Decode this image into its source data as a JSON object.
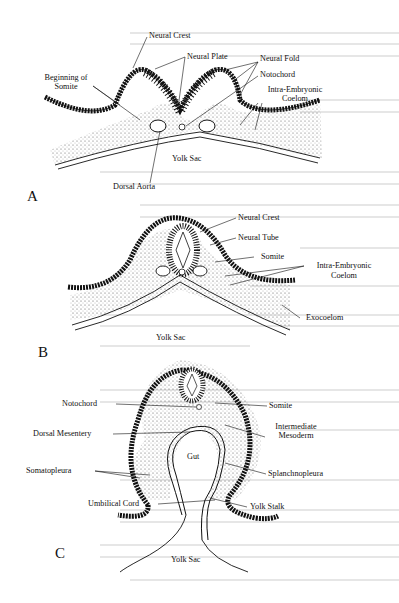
{
  "figure": {
    "panels": [
      {
        "id": "A",
        "label": "A",
        "labels": {
          "neural_crest": "Neural Crest",
          "neural_plate": "Neural Plate",
          "neural_fold": "Neural Fold",
          "notochord": "Notochord",
          "beginning_of": "Beginning of",
          "somite": "Somite",
          "intra_embryonic": "Intra-Embryonic",
          "coelom": "Coelom",
          "yolk_sac": "Yolk Sac",
          "dorsal_aorta": "Dorsal Aorta"
        }
      },
      {
        "id": "B",
        "label": "B",
        "labels": {
          "neural_crest": "Neural Crest",
          "neural_tube": "Neural Tube",
          "somite": "Somite",
          "intra_embryonic": "Intra-Embryonic",
          "coelom": "Coelom",
          "exocoelom": "Exocoelom",
          "yolk_sac": "Yolk Sac"
        }
      },
      {
        "id": "C",
        "label": "C",
        "labels": {
          "notochord": "Notochord",
          "somite": "Somite",
          "intermediate": "Intermediate",
          "mesoderm": "Mesoderm",
          "dorsal_mesentery": "Dorsal Mesentery",
          "gut": "Gut",
          "somatopleura": "Somatopleura",
          "splanchnopleura": "Splanchnopleura",
          "umbilical_cord": "Umbilical Cord",
          "yolk_stalk": "Yolk Stalk",
          "yolk_sac": "Yolk Sac"
        }
      }
    ]
  }
}
